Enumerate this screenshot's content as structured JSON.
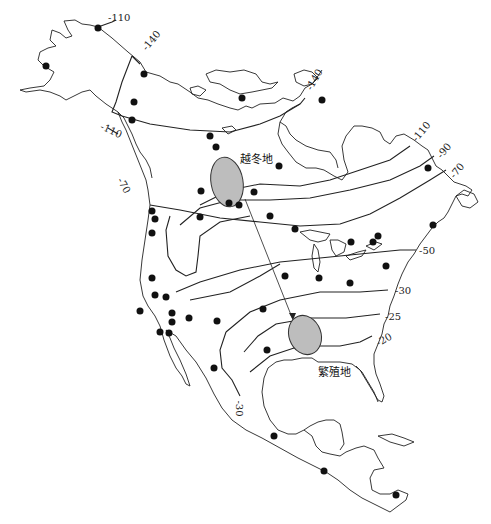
{
  "map": {
    "region": "North America",
    "areas": {
      "wintering": "越冬地",
      "breeding": "繁殖地"
    },
    "contour_labels": [
      {
        "id": "c1",
        "text": "-110",
        "x": 108,
        "y": 18,
        "rot": 0
      },
      {
        "id": "c2",
        "text": "-140",
        "x": 140,
        "y": 40,
        "rot": -50
      },
      {
        "id": "c3",
        "text": "-140",
        "x": 300,
        "y": 105,
        "rot": -60
      },
      {
        "id": "c4",
        "text": "-110",
        "x": 100,
        "y": 128,
        "rot": 25
      },
      {
        "id": "c5",
        "text": "-70",
        "x": 116,
        "y": 181,
        "rot": 60
      },
      {
        "id": "c6",
        "text": "-110",
        "x": 410,
        "y": 130,
        "rot": -50
      },
      {
        "id": "c7",
        "text": "-90",
        "x": 437,
        "y": 148,
        "rot": -50
      },
      {
        "id": "c8",
        "text": "-70",
        "x": 449,
        "y": 168,
        "rot": -50
      },
      {
        "id": "c9",
        "text": "-50",
        "x": 419,
        "y": 252,
        "rot": 0
      },
      {
        "id": "c10",
        "text": "-30",
        "x": 395,
        "y": 292,
        "rot": 0
      },
      {
        "id": "c11",
        "text": "-25",
        "x": 385,
        "y": 316,
        "rot": 0
      },
      {
        "id": "c12",
        "text": "-20",
        "x": 375,
        "y": 337,
        "rot": -30
      },
      {
        "id": "c13",
        "text": "-30",
        "x": 236,
        "y": 400,
        "rot": 90
      }
    ],
    "station_count": 45
  }
}
